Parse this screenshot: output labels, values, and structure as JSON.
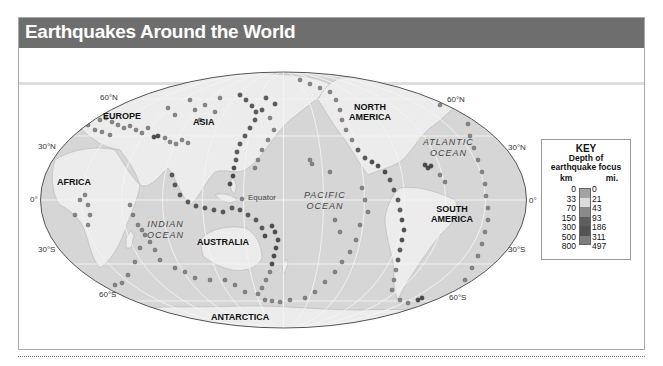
{
  "title": "Earthquakes Around the World",
  "map": {
    "projection": "Mollweide (world ellipse)",
    "latitude_labels": {
      "n60_left": "60°N",
      "n30_left": "30°N",
      "eq_left": "0°",
      "s30_left": "30°S",
      "s60_left": "60°S",
      "n60_right": "60°N",
      "n30_right": "30°N",
      "eq_right": "0°",
      "s30_right": "30°S",
      "s60_right": "60°S"
    },
    "equator_label": "Equator",
    "continents": {
      "europe": "EUROPE",
      "asia": "ASIA",
      "africa": "AFRICA",
      "australia": "AUSTRALIA",
      "antarctica": "ANTARCTICA",
      "north_america_1": "NORTH",
      "north_america_2": "AMERICA",
      "south_america_1": "SOUTH",
      "south_america_2": "AMERICA"
    },
    "oceans": {
      "indian_1": "INDIAN",
      "indian_2": "OCEAN",
      "pacific_1": "PACIFIC",
      "pacific_2": "OCEAN",
      "atlantic_1": "ATLANTIC",
      "atlantic_2": "OCEAN"
    },
    "colors": {
      "ocean": "#d6d6d6",
      "land": "#ececec",
      "gridline": "#f7f7f7",
      "outline": "#555555",
      "quake": "#7a7a7a"
    }
  },
  "key": {
    "title": "KEY",
    "subtitle_1": "Depth of",
    "subtitle_2": "earthquake focus",
    "unit_km": "km",
    "unit_mi": "mi.",
    "rows": [
      {
        "km": "0",
        "mi": "0"
      },
      {
        "km": "33",
        "mi": "21",
        "color": "#a3a3a3"
      },
      {
        "km": "70",
        "mi": "43",
        "color": "#dcdcdc"
      },
      {
        "km": "150",
        "mi": "93",
        "color": "#8a8a8a"
      },
      {
        "km": "300",
        "mi": "186",
        "color": "#5e5e5e"
      },
      {
        "km": "500",
        "mi": "311",
        "color": "#535353"
      },
      {
        "km": "800",
        "mi": "497",
        "color": "#7d7d7d"
      }
    ]
  }
}
